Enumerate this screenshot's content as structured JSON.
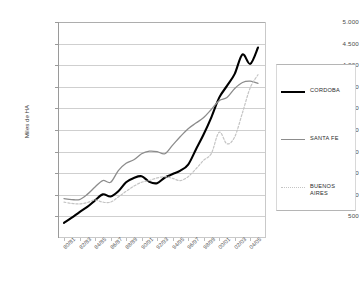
{
  "chart_data": {
    "type": "line",
    "title": "",
    "xlabel": "",
    "ylabel": "Miles de HA",
    "ylim": [
      0,
      5000
    ],
    "ytick_values": [
      500,
      1000,
      1500,
      2000,
      2500,
      3000,
      3500,
      4000,
      4500,
      5000
    ],
    "ytick_labels": [
      "500",
      "1.000",
      "1.500",
      "2.000",
      "2.500",
      "3.000",
      "3.500",
      "4.000",
      "4.500",
      "5.000"
    ],
    "grid": true,
    "legend_position": "right",
    "x": [
      "80/81",
      "81/82",
      "82/83",
      "83/84",
      "84/85",
      "85/86",
      "86/87",
      "87/88",
      "88/89",
      "89/90",
      "90/91",
      "91/92",
      "92/93",
      "93/94",
      "94/95",
      "95/96",
      "96/97",
      "97/98",
      "98/99",
      "99/00",
      "00/01",
      "01/02",
      "02/03",
      "03/04",
      "04/05",
      "05/06"
    ],
    "xtick_labels": [
      "80/81",
      "82/83",
      "84/85",
      "86/87",
      "88/89",
      "90/91",
      "92/93",
      "94/95",
      "96/97",
      "98/99",
      "00/01",
      "02/03",
      "04/05"
    ],
    "xtick_every": 2,
    "series": [
      {
        "name": "CORDOBA",
        "color": "#000000",
        "style": "solid",
        "width": 2.1,
        "values": [
          350,
          470,
          600,
          720,
          870,
          1010,
          960,
          1080,
          1290,
          1390,
          1430,
          1300,
          1270,
          1400,
          1480,
          1560,
          1700,
          2050,
          2400,
          2800,
          3250,
          3520,
          3800,
          4250,
          4030,
          4410
        ]
      },
      {
        "name": "SANTA FE",
        "color": "#8c8c8c",
        "style": "solid",
        "width": 1.3,
        "values": [
          910,
          890,
          890,
          1010,
          1180,
          1330,
          1290,
          1560,
          1730,
          1810,
          1950,
          2010,
          2000,
          1950,
          2150,
          2350,
          2530,
          2660,
          2790,
          2980,
          3180,
          3250,
          3460,
          3600,
          3630,
          3580
        ]
      },
      {
        "name": "BUENOS AIRES",
        "color": "#c4c4c4",
        "style": "dotted",
        "width": 1.2,
        "values": [
          830,
          800,
          790,
          820,
          880,
          830,
          830,
          950,
          1080,
          1200,
          1290,
          1330,
          1390,
          1420,
          1380,
          1330,
          1420,
          1600,
          1800,
          1960,
          2450,
          2180,
          2340,
          2900,
          3480,
          3780
        ]
      }
    ]
  },
  "legend": {
    "entries": [
      {
        "label": "CORDOBA",
        "name": "legend-item-cordoba"
      },
      {
        "label": "SANTA FE",
        "name": "legend-item-santa-fe"
      },
      {
        "label": "BUENOS\nAIRES",
        "name": "legend-item-buenos-aires"
      }
    ]
  },
  "axes": {
    "y_title": "Miles de HA"
  }
}
